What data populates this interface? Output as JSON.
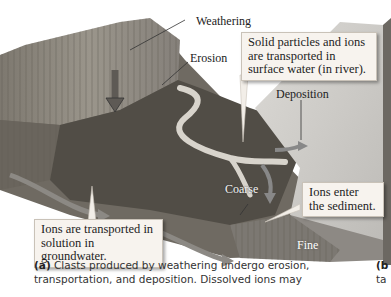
{
  "figure": {
    "labels": {
      "weathering": "Weathering",
      "erosion": "Erosion",
      "deposition": "Deposition",
      "coarse": "Coarse",
      "fine": "Fine"
    },
    "callouts": {
      "surface_water": "Solid particles and ions are transported in surface water (in river).",
      "groundwater": "Ions are transported in solution in groundwater.",
      "sediment": "Ions enter the sediment."
    },
    "caption_a": {
      "marker": "(a)",
      "text": "Clasts produced by weathering undergo erosion, transportation, and deposition. Dissolved ions may"
    },
    "caption_b": {
      "marker": "(b",
      "text": "ta"
    },
    "colors": {
      "cliff": "#8a857c",
      "vegetation": "#4f4b44",
      "river": "#d9d6cf",
      "sea": "#c8c6c2",
      "arrow": "#6d6a66",
      "callout_bg": "#f7f3ee"
    }
  }
}
